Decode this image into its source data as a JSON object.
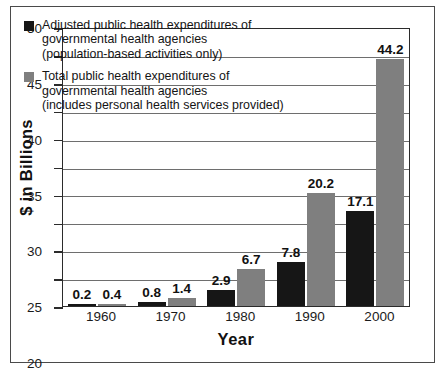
{
  "chart_data": {
    "type": "bar",
    "title": "",
    "xlabel": "Year",
    "ylabel": "$ in Billions",
    "categories": [
      "1960",
      "1970",
      "1980",
      "1990",
      "2000"
    ],
    "ylim": [
      0,
      50
    ],
    "ytick_values": [
      0,
      5,
      10,
      15,
      20,
      25,
      30,
      35,
      40,
      45,
      50
    ],
    "ytick_labels": [
      "0",
      "5",
      "10",
      "15",
      "20",
      "25",
      "30",
      "35",
      "40",
      "45",
      "50"
    ],
    "grid": true,
    "legend_position": "upper-left-inside",
    "series": [
      {
        "name": "Adjusted public health expenditures of governmental health agencies (population-based activities only)",
        "color": "#161616",
        "values": [
          0.2,
          0.8,
          2.9,
          7.8,
          17.1
        ],
        "value_labels": [
          "0.2",
          "0.8",
          "2.9",
          "7.8",
          "17.1"
        ]
      },
      {
        "name": "Total public health expenditures of governmental health agencies (includes personal health services provided)",
        "color": "#7f7f7f",
        "values": [
          0.4,
          1.4,
          6.7,
          20.2,
          44.2
        ],
        "value_labels": [
          "0.4",
          "1.4",
          "6.7",
          "20.2",
          "44.2"
        ]
      }
    ]
  },
  "legend": [
    {
      "swatch": "dark",
      "lines": [
        "Adjusted public health expenditures of",
        "governmental health agencies",
        "(population-based activities only)"
      ]
    },
    {
      "swatch": "gray",
      "lines": [
        "Total public health expenditures of",
        "governmental health agencies",
        "(includes personal health services provided)"
      ]
    }
  ]
}
